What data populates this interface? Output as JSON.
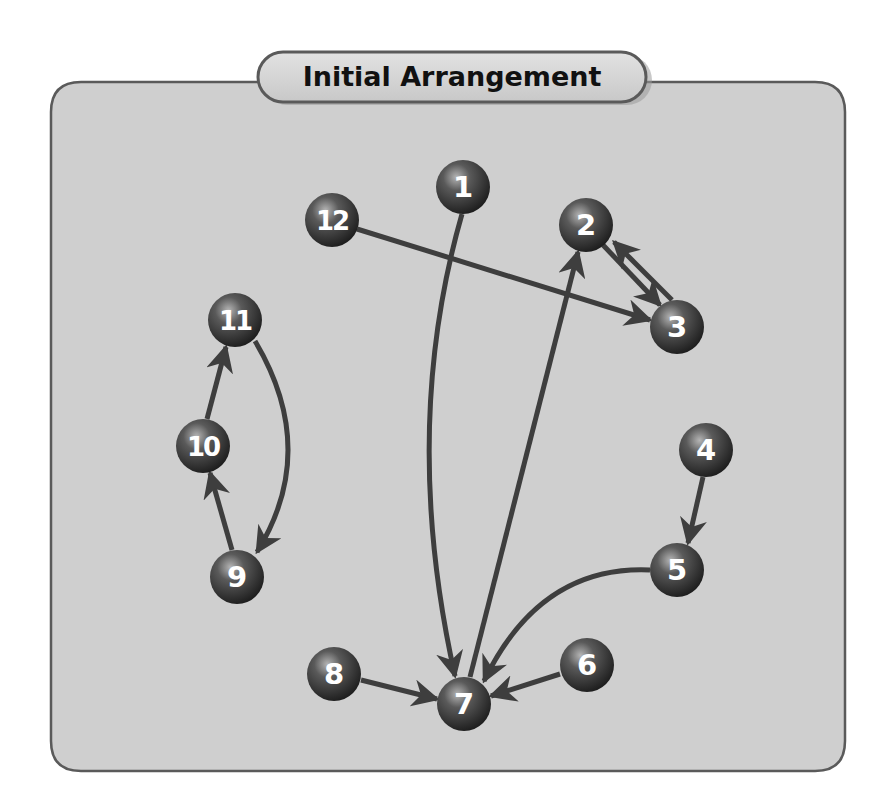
{
  "title": "Initial Arrangement",
  "colors": {
    "background": "#ffffff",
    "panel_fill": "#cfcfcf",
    "panel_border": "#5a5a5a",
    "pill_fill": "#d4d4d4",
    "edge": "#3e3e3e",
    "node_dark": "#1e1e1e",
    "node_mid": "#5a5a5a",
    "node_highlight": "#b5b5b5",
    "label": "#ffffff",
    "title_text": "#111111"
  },
  "nodes": [
    {
      "id": "1",
      "label": "1",
      "x": 463,
      "y": 187
    },
    {
      "id": "2",
      "label": "2",
      "x": 586,
      "y": 225
    },
    {
      "id": "3",
      "label": "3",
      "x": 677,
      "y": 327
    },
    {
      "id": "4",
      "label": "4",
      "x": 706,
      "y": 450
    },
    {
      "id": "5",
      "label": "5",
      "x": 677,
      "y": 570
    },
    {
      "id": "6",
      "label": "6",
      "x": 587,
      "y": 665
    },
    {
      "id": "7",
      "label": "7",
      "x": 464,
      "y": 704
    },
    {
      "id": "8",
      "label": "8",
      "x": 334,
      "y": 674
    },
    {
      "id": "9",
      "label": "9",
      "x": 237,
      "y": 577
    },
    {
      "id": "10",
      "label": "10",
      "x": 203,
      "y": 446
    },
    {
      "id": "11",
      "label": "11",
      "x": 235,
      "y": 320
    },
    {
      "id": "12",
      "label": "12",
      "x": 332,
      "y": 220
    }
  ],
  "edges": [
    {
      "from": "1",
      "to": "7",
      "path": "M 462 214 Q 400 430 455 676"
    },
    {
      "from": "7",
      "to": "2",
      "path": "M 470 677 L 578 252"
    },
    {
      "from": "12",
      "to": "3",
      "path": "M 357 229 L 650 320"
    },
    {
      "from": "2",
      "to": "3",
      "path": "M 603 245 L 660 305"
    },
    {
      "from": "3",
      "to": "2",
      "path": "M 672 300 L 614 242"
    },
    {
      "from": "4",
      "to": "5",
      "path": "M 703 477 L 688 543"
    },
    {
      "from": "5",
      "to": "7",
      "path": "M 650 570 Q 540 565 484 681"
    },
    {
      "from": "6",
      "to": "7",
      "path": "M 560 674 L 491 696"
    },
    {
      "from": "8",
      "to": "7",
      "path": "M 361 680 L 437 699"
    },
    {
      "from": "9",
      "to": "10",
      "path": "M 232 550 L 210 473"
    },
    {
      "from": "10",
      "to": "11",
      "path": "M 207 419 L 226 347"
    },
    {
      "from": "11",
      "to": "9",
      "path": "M 255 341 Q 320 450 257 552"
    }
  ]
}
